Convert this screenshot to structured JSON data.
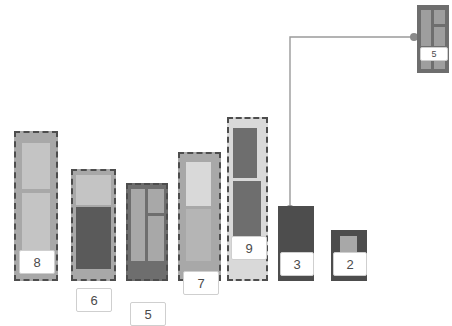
{
  "view": {
    "title": "treemap-node-diagram",
    "width": 452,
    "height": 299,
    "background": "#ffffff"
  },
  "palette": {
    "dash_border": "#4d4d4d",
    "chip_fill": "#ffffff",
    "chip_border": "#cfcfcf",
    "chip_text": "#4a4a4a",
    "link_stroke": "#9a9a9a",
    "link_dot": "#8a8a8a",
    "gray_light": "#d9d9d9",
    "gray_mid_light": "#c4c4c4",
    "gray_mid": "#a8a8a8",
    "gray_mid_dark": "#8f8f8f",
    "gray_dark": "#6e6e6e",
    "gray_darker": "#5a5a5a",
    "gray_darkest": "#4d4d4d"
  },
  "chart_data": {
    "type": "treemap",
    "title": "",
    "xlabel": "",
    "ylabel": "",
    "note": "Seven ground-anchored column nodes plus one detached node linked by an elbow connector.",
    "categories": [
      "8",
      "6",
      "5",
      "7",
      "9",
      "3",
      "2"
    ],
    "values": [
      8,
      6,
      5,
      7,
      9,
      3,
      2
    ],
    "detached": {
      "label": "5",
      "value": 5
    },
    "link": {
      "from": "detached-node-5",
      "to": "node-3"
    }
  },
  "nodes": [
    {
      "id": "node-8",
      "label": "8",
      "dashed": true,
      "x": 14,
      "y": 131,
      "w": 44,
      "h": 150,
      "fill": "#a8a8a8",
      "cells": [
        {
          "x": 8,
          "y": 12,
          "w": 28,
          "h": 46,
          "fill": "#c4c4c4"
        },
        {
          "x": 8,
          "y": 62,
          "w": 28,
          "h": 66,
          "fill": "#c4c4c4"
        }
      ],
      "chip": {
        "x": 5,
        "y": 119,
        "w": 34,
        "h": 22
      }
    },
    {
      "id": "node-6",
      "label": "6",
      "dashed": true,
      "x": 71,
      "y": 169,
      "w": 45,
      "h": 112,
      "fill": "#a8a8a8",
      "cells": [
        {
          "x": 5,
          "y": 6,
          "w": 35,
          "h": 30,
          "fill": "#c4c4c4"
        },
        {
          "x": 5,
          "y": 38,
          "w": 35,
          "h": 62,
          "fill": "#5a5a5a"
        }
      ],
      "chip": {
        "x": 5,
        "y": 119,
        "w": 34,
        "h": 22
      }
    },
    {
      "id": "node-5",
      "label": "5",
      "dashed": true,
      "x": 126,
      "y": 183,
      "w": 42,
      "h": 98,
      "fill": "#6e6e6e",
      "cells": [
        {
          "x": 5,
          "y": 6,
          "w": 14,
          "h": 72,
          "fill": "#a8a8a8"
        },
        {
          "x": 22,
          "y": 6,
          "w": 16,
          "h": 24,
          "fill": "#a8a8a8"
        },
        {
          "x": 22,
          "y": 33,
          "w": 16,
          "h": 45,
          "fill": "#a8a8a8"
        }
      ],
      "chip": {
        "x": 4,
        "y": 119,
        "w": 34,
        "h": 22
      }
    },
    {
      "id": "node-7",
      "label": "7",
      "dashed": true,
      "x": 178,
      "y": 152,
      "w": 43,
      "h": 129,
      "fill": "#a8a8a8",
      "cells": [
        {
          "x": 8,
          "y": 10,
          "w": 25,
          "h": 44,
          "fill": "#d9d9d9"
        },
        {
          "x": 8,
          "y": 57,
          "w": 25,
          "h": 52,
          "fill": "#b5b5b5"
        }
      ],
      "chip": {
        "x": 5,
        "y": 119,
        "w": 34,
        "h": 22
      }
    },
    {
      "id": "node-9",
      "label": "9",
      "dashed": true,
      "x": 227,
      "y": 117,
      "w": 41,
      "h": 164,
      "fill": "#d9d9d9",
      "cells": [
        {
          "x": 6,
          "y": 11,
          "w": 24,
          "h": 50,
          "fill": "#6e6e6e"
        },
        {
          "x": 6,
          "y": 64,
          "w": 28,
          "h": 75,
          "fill": "#6e6e6e"
        }
      ],
      "chip": {
        "x": 4,
        "y": 119,
        "w": 34,
        "h": 22
      }
    },
    {
      "id": "node-3",
      "label": "3",
      "dashed": false,
      "x": 278,
      "y": 206,
      "w": 36,
      "h": 75,
      "fill": "#4d4d4d",
      "cells": [],
      "chip": {
        "x": 2,
        "y": 46,
        "w": 32,
        "h": 22
      }
    },
    {
      "id": "node-2",
      "label": "2",
      "dashed": false,
      "x": 331,
      "y": 230,
      "w": 36,
      "h": 51,
      "fill": "#4d4d4d",
      "cells": [
        {
          "x": 9,
          "y": 6,
          "w": 17,
          "h": 22,
          "fill": "#a8a8a8"
        }
      ],
      "chip": {
        "x": 2,
        "y": 22,
        "w": 32,
        "h": 22
      }
    }
  ],
  "detached_node": {
    "id": "detached-node-5",
    "label": "5",
    "x": 417,
    "y": 5,
    "w": 32,
    "h": 68,
    "fill": "#6e6e6e",
    "cells": [
      {
        "x": 4,
        "y": 5,
        "w": 10,
        "h": 36,
        "fill": "#9e9e9e"
      },
      {
        "x": 17,
        "y": 5,
        "w": 11,
        "h": 14,
        "fill": "#9e9e9e"
      },
      {
        "x": 17,
        "y": 22,
        "w": 11,
        "h": 19,
        "fill": "#9e9e9e"
      },
      {
        "x": 4,
        "y": 55,
        "w": 10,
        "h": 9,
        "fill": "#9e9e9e"
      },
      {
        "x": 17,
        "y": 55,
        "w": 11,
        "h": 9,
        "fill": "#9e9e9e"
      }
    ],
    "chip": {
      "x": 3,
      "y": 42,
      "w": 26,
      "h": 12
    }
  },
  "connector": {
    "path": "M 414 37 L 290 37 L 290 212",
    "dot_from": {
      "cx": 414,
      "cy": 37,
      "r": 4
    },
    "dot_to": {
      "cx": 290,
      "cy": 209,
      "r": 4
    },
    "stroke_width": 1.4
  }
}
